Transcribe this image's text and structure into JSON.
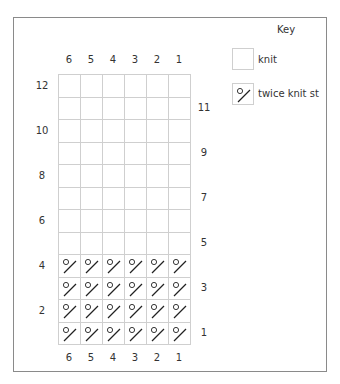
{
  "key": {
    "title": "Key",
    "items": [
      {
        "symbol": "blank",
        "label": "knit"
      },
      {
        "symbol": "circle-slash",
        "label": "twice knit st"
      }
    ]
  },
  "chart": {
    "columns_top": [
      "6",
      "5",
      "4",
      "3",
      "2",
      "1"
    ],
    "columns_bottom": [
      "6",
      "5",
      "4",
      "3",
      "2",
      "1"
    ],
    "rows_left": [
      "12",
      "10",
      "8",
      "6",
      "4",
      "2"
    ],
    "rows_right": [
      "11",
      "9",
      "7",
      "5",
      "3",
      "1"
    ],
    "row_count": 12,
    "col_count": 6,
    "rows": [
      [
        "knit",
        "knit",
        "knit",
        "knit",
        "knit",
        "knit"
      ],
      [
        "knit",
        "knit",
        "knit",
        "knit",
        "knit",
        "knit"
      ],
      [
        "knit",
        "knit",
        "knit",
        "knit",
        "knit",
        "knit"
      ],
      [
        "knit",
        "knit",
        "knit",
        "knit",
        "knit",
        "knit"
      ],
      [
        "knit",
        "knit",
        "knit",
        "knit",
        "knit",
        "knit"
      ],
      [
        "knit",
        "knit",
        "knit",
        "knit",
        "knit",
        "knit"
      ],
      [
        "knit",
        "knit",
        "knit",
        "knit",
        "knit",
        "knit"
      ],
      [
        "knit",
        "knit",
        "knit",
        "knit",
        "knit",
        "knit"
      ],
      [
        "twice knit st",
        "twice knit st",
        "twice knit st",
        "twice knit st",
        "twice knit st",
        "twice knit st"
      ],
      [
        "twice knit st",
        "twice knit st",
        "twice knit st",
        "twice knit st",
        "twice knit st",
        "twice knit st"
      ],
      [
        "twice knit st",
        "twice knit st",
        "twice knit st",
        "twice knit st",
        "twice knit st",
        "twice knit st"
      ],
      [
        "twice knit st",
        "twice knit st",
        "twice knit st",
        "twice knit st",
        "twice knit st",
        "twice knit st"
      ]
    ]
  },
  "colors": {
    "grid_line": "#cfcfcf",
    "frame": "#8a8a8a",
    "symbol": "#222222"
  }
}
